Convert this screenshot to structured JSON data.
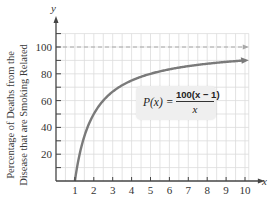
{
  "chart_data": {
    "type": "line",
    "title": "",
    "xlabel": "x",
    "ylabel": "y",
    "y_axis_description": [
      "Percentage of Deaths from the",
      "Disease that are Smoking Related"
    ],
    "x_ticks": [
      1,
      2,
      3,
      4,
      5,
      6,
      7,
      8,
      9,
      10
    ],
    "y_ticks": [
      20,
      40,
      60,
      80,
      100
    ],
    "xlim": [
      0,
      10.3
    ],
    "ylim": [
      0,
      110
    ],
    "grid": true,
    "function": "P(x) = 100(x - 1)/x",
    "series": [
      {
        "name": "P(x)",
        "color": "#7a7a7a",
        "x": [
          1,
          1.25,
          1.5,
          2,
          2.5,
          3,
          4,
          5,
          6,
          7,
          8,
          9,
          10
        ],
        "values": [
          0,
          20,
          33.3,
          50,
          60,
          66.7,
          75,
          80,
          83.3,
          85.7,
          87.5,
          88.9,
          90
        ]
      }
    ],
    "asymptote": {
      "y": 100,
      "style": "dashed",
      "color": "#a0a0a0"
    },
    "annotation": {
      "lhs": "P(x) =",
      "numerator": "100(x − 1)",
      "denominator": "x"
    }
  },
  "axis_labels": {
    "x": "x",
    "y": "y",
    "y_desc_line1": "Percentage of Deaths from the",
    "y_desc_line2": "Disease that are Smoking Related"
  },
  "tick_labels": {
    "x": [
      "1",
      "2",
      "3",
      "4",
      "5",
      "6",
      "7",
      "8",
      "9",
      "10"
    ],
    "y": [
      "20",
      "40",
      "60",
      "80",
      "100"
    ]
  },
  "colors": {
    "curve": "#7a7a7a",
    "grid": "#dcdcdc",
    "axis": "#444444",
    "dashed": "#a8a8a8",
    "box": "#efefef"
  }
}
